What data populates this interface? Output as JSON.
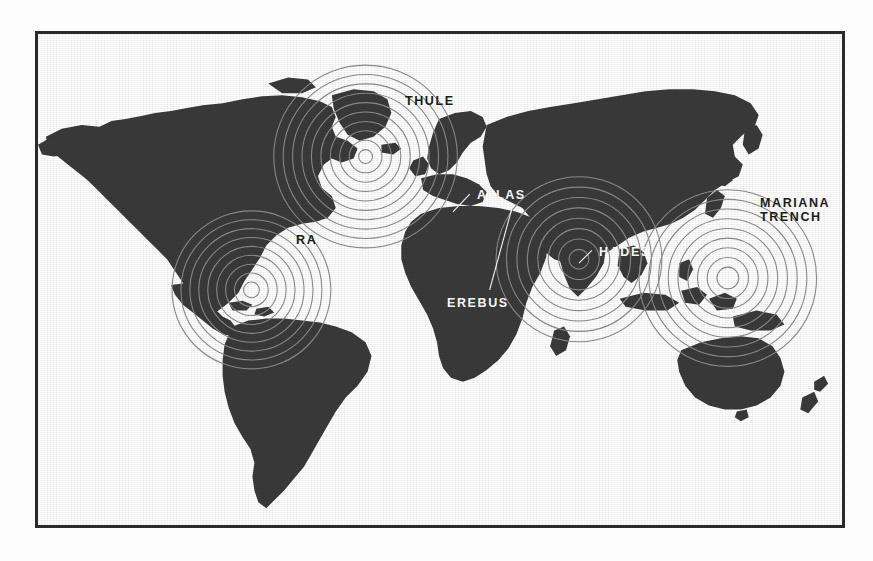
{
  "page": {
    "background_color": "#fdfdfd",
    "frame_color": "#2b2b2b",
    "land_color": "#3a3a3a",
    "ocean_color": "#ffffff",
    "ripple_color": "#8c8c8c"
  },
  "map": {
    "title": "",
    "projection": "world-equirectangular",
    "land_fill": "#3a3a3a",
    "ocean_fill": "#ffffff"
  },
  "sites": [
    {
      "id": "thule",
      "label": "THULE",
      "label_color": "dark",
      "label_x": 367,
      "label_y": 61,
      "ripple": {
        "cx": 330,
        "cy": 124,
        "rings": 10,
        "spacing": 9.5,
        "start": 7
      },
      "leader": null
    },
    {
      "id": "ra",
      "label": "RA",
      "label_color": "dark",
      "label_x": 258,
      "label_y": 200,
      "ripple": {
        "cx": 215,
        "cy": 259,
        "rings": 9,
        "spacing": 9.0,
        "start": 8
      },
      "leader": null
    },
    {
      "id": "atlas",
      "label": "ATLAS",
      "label_color": "light",
      "label_x": 439,
      "label_y": 155,
      "ripple": null,
      "leader": {
        "x1": 435,
        "y1": 162,
        "x2": 418,
        "y2": 180
      }
    },
    {
      "id": "erebus",
      "label": "EREBUS",
      "label_color": "light",
      "label_x": 409,
      "label_y": 263,
      "ripple": null,
      "leader": {
        "x1": 455,
        "y1": 259,
        "x2": 477,
        "y2": 178
      }
    },
    {
      "id": "hades",
      "label": "HADES",
      "label_color": "light",
      "label_x": 561,
      "label_y": 212,
      "ripple": {
        "cx": 545,
        "cy": 228,
        "rings": 8,
        "spacing": 10.5,
        "start": 10
      },
      "leader": {
        "x1": 558,
        "y1": 219,
        "x2": 545,
        "y2": 232
      }
    },
    {
      "id": "mariana-trench",
      "label": "MARIANA\nTRENCH",
      "label_line_1": "MARIANA",
      "label_line_2": "TRENCH",
      "label_color": "dark",
      "label_x": 722,
      "label_y": 163,
      "ripple": {
        "cx": 695,
        "cy": 247,
        "rings": 9,
        "spacing": 9.8,
        "start": 11
      },
      "leader": null
    }
  ]
}
